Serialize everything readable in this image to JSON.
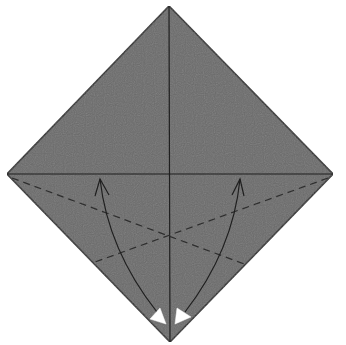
{
  "diagram": {
    "paper": {
      "fill": "#6b6b6b",
      "edge": "#2a2a2a",
      "vertices": {
        "top": [
          169,
          6
        ],
        "right": [
          333,
          174
        ],
        "bottom": [
          170,
          342
        ],
        "left": [
          7,
          174
        ]
      }
    },
    "creases": {
      "vertical": {
        "from": [
          169,
          6
        ],
        "to": [
          170,
          342
        ],
        "style": "solid"
      },
      "horizontal": {
        "from": [
          7,
          174
        ],
        "to": [
          333,
          174
        ],
        "style": "solid"
      },
      "valley_left": {
        "from": [
          12,
          178
        ],
        "to": [
          247,
          265
        ],
        "style": "dashed"
      },
      "valley_right": {
        "from": [
          328,
          178
        ],
        "to": [
          95,
          262
        ],
        "style": "dashed"
      }
    },
    "arrows": [
      {
        "name": "fold-left-edge-arrow",
        "from": [
          160,
          312
        ],
        "to": [
          100,
          178
        ]
      },
      {
        "name": "fold-right-edge-arrow",
        "from": [
          182,
          312
        ],
        "to": [
          240,
          178
        ]
      }
    ],
    "markers": [
      {
        "name": "left-fold-marker",
        "points": [
          [
            150,
            319
          ],
          [
            160,
            308
          ],
          [
            166,
            324
          ]
        ],
        "fill": "#ffffff"
      },
      {
        "name": "right-fold-marker",
        "points": [
          [
            177,
            308
          ],
          [
            191,
            317
          ],
          [
            175,
            324
          ]
        ],
        "fill": "#ffffff"
      }
    ],
    "instruction": "Fold the lower edges to the center crease"
  }
}
